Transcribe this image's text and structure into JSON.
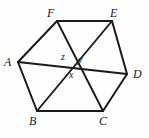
{
  "figure": {
    "kind": "geometry-diagram",
    "canvas": {
      "width": 149,
      "height": 138
    },
    "background_color": "#fefefe",
    "stroke_color": "#1a1a1a",
    "vertices": [
      {
        "id": "A",
        "label": "A",
        "x": 18,
        "y": 62,
        "label_x": 4,
        "label_y": 56
      },
      {
        "id": "B",
        "label": "B",
        "x": 37,
        "y": 111,
        "label_x": 29,
        "label_y": 115
      },
      {
        "id": "C",
        "label": "C",
        "x": 103,
        "y": 111,
        "label_x": 99,
        "label_y": 115
      },
      {
        "id": "D",
        "label": "D",
        "x": 127,
        "y": 74,
        "label_x": 133,
        "label_y": 68
      },
      {
        "id": "E",
        "label": "E",
        "x": 112,
        "y": 21,
        "label_x": 110,
        "label_y": 7
      },
      {
        "id": "F",
        "label": "F",
        "x": 57,
        "y": 21,
        "label_x": 47,
        "label_y": 7
      }
    ],
    "edges": [
      {
        "from": "A",
        "to": "B"
      },
      {
        "from": "B",
        "to": "C"
      },
      {
        "from": "C",
        "to": "D"
      },
      {
        "from": "D",
        "to": "E"
      },
      {
        "from": "E",
        "to": "F"
      },
      {
        "from": "F",
        "to": "A"
      }
    ],
    "diagonals": [
      {
        "from": "A",
        "to": "D"
      },
      {
        "from": "B",
        "to": "E"
      },
      {
        "from": "C",
        "to": "F"
      }
    ],
    "angle_labels": [
      {
        "id": "z",
        "label": "z",
        "label_x": 61,
        "label_y": 52
      },
      {
        "id": "y",
        "label": "y",
        "label_x": 78,
        "label_y": 55
      },
      {
        "id": "x",
        "label": "x",
        "label_x": 69,
        "label_y": 70
      }
    ]
  }
}
